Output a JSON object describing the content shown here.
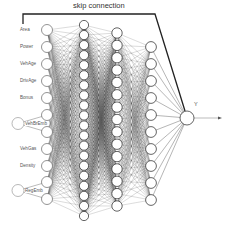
{
  "diagram": {
    "title": "skip connection",
    "output_label": "Y",
    "inputs": [
      {
        "label": "Area",
        "type": "single"
      },
      {
        "label": "Power",
        "type": "single"
      },
      {
        "label": "VehAge",
        "type": "single"
      },
      {
        "label": "DrivAge",
        "type": "single"
      },
      {
        "label": "Bonus",
        "type": "single"
      },
      {
        "label": "VehBrEmb",
        "type": "embedding",
        "dims": 2
      },
      {
        "label": "VehGas",
        "type": "single"
      },
      {
        "label": "Density",
        "type": "single"
      },
      {
        "label": "RegEmb",
        "type": "embedding",
        "dims": 2
      }
    ],
    "hidden_layers": [
      {
        "name": "hidden-layer-1",
        "nodes": 20
      },
      {
        "name": "hidden-layer-2",
        "nodes": 15
      },
      {
        "name": "hidden-layer-3",
        "nodes": 10
      }
    ],
    "output_nodes": 1,
    "colors": {
      "stroke": "#222222",
      "edge": "#333333",
      "node_fill": "#ffffff",
      "label": "#555555"
    }
  }
}
